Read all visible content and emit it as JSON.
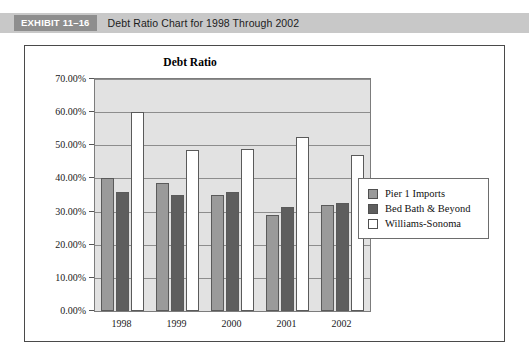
{
  "exhibit": {
    "tag": "EXHIBIT 11–16",
    "title": "Debt Ratio Chart for 1998 Through 2002"
  },
  "legend": {
    "position": "right",
    "items": [
      {
        "label": "Pier 1 Imports",
        "color": "#9a9a9a",
        "swatch": "legend-swatch-pier-1-imports"
      },
      {
        "label": "Bed Bath & Beyond",
        "color": "#5e5e5e",
        "swatch": "legend-swatch-bed-bath-beyond"
      },
      {
        "label": "Williams-Sonoma",
        "color": "#ffffff",
        "swatch": "legend-swatch-williams-sonoma"
      }
    ]
  },
  "chart_data": {
    "type": "bar",
    "title": "Debt Ratio",
    "xlabel": "",
    "ylabel": "",
    "categories": [
      "1998",
      "1999",
      "2000",
      "2001",
      "2002"
    ],
    "series": [
      {
        "name": "Pier 1 Imports",
        "color": "#9a9a9a",
        "values": [
          40.0,
          38.5,
          35.0,
          29.0,
          32.0
        ]
      },
      {
        "name": "Bed Bath & Beyond",
        "color": "#5e5e5e",
        "values": [
          36.0,
          35.0,
          36.0,
          31.5,
          32.5
        ]
      },
      {
        "name": "Williams-Sonoma",
        "color": "#ffffff",
        "values": [
          60.0,
          48.5,
          49.0,
          52.5,
          47.0
        ]
      }
    ],
    "ylim": [
      0,
      70
    ],
    "ytick_values": [
      0,
      10,
      20,
      30,
      40,
      50,
      60,
      70
    ],
    "ytick_labels": [
      "0.00%",
      "10.00%",
      "20.00%",
      "30.00%",
      "40.00%",
      "50.00%",
      "60.00%",
      "70.00%"
    ],
    "grid": true,
    "plot_background": "#e2e2e2"
  }
}
